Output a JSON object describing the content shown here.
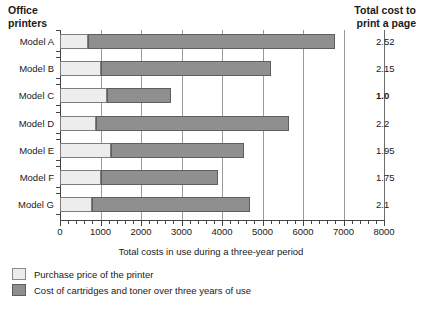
{
  "header": {
    "left_title_line1": "Office",
    "left_title_line2": "printers",
    "right_title_line1": "Total cost to",
    "right_title_line2": "print a page"
  },
  "legend": {
    "items": [
      {
        "swatch": "light-swatch",
        "label": "Purchase price of the printer",
        "color": "#ededed"
      },
      {
        "swatch": "dark-swatch",
        "label": "Cost of cartridges and toner over three years of use",
        "color": "#8f8f8f"
      }
    ]
  },
  "chart_data": {
    "type": "bar",
    "orientation": "horizontal",
    "stacked": true,
    "title": "",
    "xlabel": "Total costs in use during a three-year period",
    "ylabel": "",
    "xlim": [
      0,
      8000
    ],
    "xticks": [
      0,
      1000,
      2000,
      3000,
      4000,
      5000,
      6000,
      7000,
      8000
    ],
    "xtick_labels": [
      "0",
      "1000",
      "2000",
      "3000",
      "4000",
      "5000",
      "6000",
      "7000",
      "8000"
    ],
    "minor_tick_interval": 200,
    "grid": "vertical",
    "legend_position": "below",
    "categories": [
      "Model A",
      "Model B",
      "Model C",
      "Model D",
      "Model E",
      "Model F",
      "Model G"
    ],
    "series": [
      {
        "name": "Purchase price of the printer",
        "color": "#ededed",
        "values": [
          700,
          1000,
          1150,
          900,
          1250,
          1000,
          800
        ]
      },
      {
        "name": "Cost of cartridges and toner over three years of use",
        "color": "#8f8f8f",
        "values": [
          6100,
          4200,
          1600,
          4750,
          3300,
          2900,
          3900
        ]
      }
    ],
    "totals": [
      6800,
      5200,
      2750,
      5650,
      4550,
      3900,
      4700
    ],
    "secondary_axis": {
      "label_line1": "Total cost to",
      "label_line2": "print a page",
      "values": [
        "2.52",
        "2.15",
        "1.0",
        "2.2",
        "1.95",
        "1.75",
        "2.1"
      ],
      "emphasized_index": 2
    }
  }
}
